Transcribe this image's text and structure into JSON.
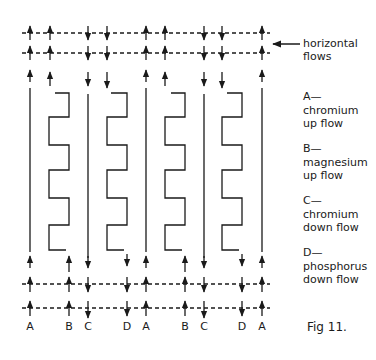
{
  "diagram": {
    "type": "flow schematic",
    "pointer_label": [
      "horizontal",
      "flows"
    ],
    "figure_caption": "Fig 11.",
    "columns": [
      {
        "letter": "A",
        "x": 30,
        "direction": "up",
        "kind": "straight"
      },
      {
        "letter": "B",
        "x": 50,
        "direction": "up",
        "kind": "serpentine"
      },
      {
        "letter": "C",
        "x": 88,
        "direction": "down",
        "kind": "straight"
      },
      {
        "letter": "D",
        "x": 107,
        "direction": "down",
        "kind": "serpentine"
      },
      {
        "letter": "A",
        "x": 146,
        "direction": "up",
        "kind": "straight"
      },
      {
        "letter": "B",
        "x": 165,
        "direction": "up",
        "kind": "serpentine"
      },
      {
        "letter": "C",
        "x": 204,
        "direction": "down",
        "kind": "straight"
      },
      {
        "letter": "D",
        "x": 222,
        "direction": "down",
        "kind": "serpentine"
      },
      {
        "letter": "A",
        "x": 262,
        "direction": "up",
        "kind": "straight"
      }
    ],
    "bottom_labels": [
      {
        "text": "A",
        "x": 30
      },
      {
        "text": "B",
        "x": 69
      },
      {
        "text": "C",
        "x": 88
      },
      {
        "text": "D",
        "x": 127
      },
      {
        "text": "A",
        "x": 146
      },
      {
        "text": "B",
        "x": 185
      },
      {
        "text": "C",
        "x": 204
      },
      {
        "text": "D",
        "x": 242
      },
      {
        "text": "A",
        "x": 262
      }
    ],
    "legend": [
      {
        "key": "A—",
        "lines": [
          "chromium",
          "up flow"
        ]
      },
      {
        "key": "B—",
        "lines": [
          "magnesium",
          "up flow"
        ]
      },
      {
        "key": "C—",
        "lines": [
          "chromium",
          "down flow"
        ]
      },
      {
        "key": "D—",
        "lines": [
          "phosphorus",
          "down flow"
        ]
      }
    ],
    "colors": {
      "ink": "#1a1a1a",
      "background": "#ffffff"
    }
  }
}
